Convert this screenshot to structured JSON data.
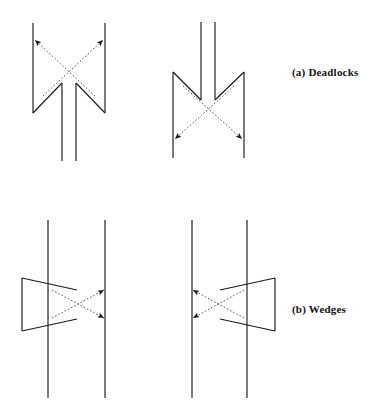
{
  "figure": {
    "background_color": "#ffffff",
    "stroke_color": "#1a1a1a",
    "dashed_stroke_color": "#3a3a3a",
    "captions": [
      {
        "id": "a",
        "label": "(a) Deadlocks",
        "x": 292,
        "y": 66
      },
      {
        "id": "b",
        "label": "(b) Wedges",
        "x": 292,
        "y": 303
      }
    ],
    "panels": [
      {
        "name": "deadlock-left",
        "row": "a",
        "column": "left",
        "description": "Two solid strands open upward with inward diagonal arms; dashed arrows point up-outward to the outer strand tops.",
        "solid_strands": [
          {
            "name": "outer-left-vertical",
            "x1": 33,
            "y1": 23,
            "x2": 33,
            "y2": 113
          },
          {
            "name": "outer-right-vertical",
            "x1": 105,
            "y1": 23,
            "x2": 105,
            "y2": 113
          },
          {
            "name": "inner-left-vertical",
            "x1": 62,
            "y1": 83,
            "x2": 62,
            "y2": 161
          },
          {
            "name": "inner-right-vertical",
            "x1": 76,
            "y1": 83,
            "x2": 76,
            "y2": 161
          },
          {
            "name": "left-arm-diagonal",
            "x1": 33,
            "y1": 113,
            "x2": 62,
            "y2": 83
          },
          {
            "name": "right-arm-diagonal",
            "x1": 105,
            "y1": 113,
            "x2": 76,
            "y2": 83
          }
        ],
        "dashed_arrows": [
          {
            "name": "arrow-up-left",
            "x1": 95,
            "y1": 96,
            "x2": 35,
            "y2": 40,
            "arrowhead_at": "end"
          },
          {
            "name": "arrow-up-right",
            "x1": 43,
            "y1": 96,
            "x2": 103,
            "y2": 40,
            "arrowhead_at": "end"
          }
        ]
      },
      {
        "name": "deadlock-right",
        "row": "a",
        "column": "right",
        "description": "Vertical mirror of the left panel: two solid strands open downward with diagonal arms; dashed arrows point down-outward.",
        "solid_strands": [
          {
            "name": "outer-left-vertical",
            "x1": 173,
            "y1": 72,
            "x2": 173,
            "y2": 158
          },
          {
            "name": "outer-right-vertical",
            "x1": 244,
            "y1": 72,
            "x2": 244,
            "y2": 158
          },
          {
            "name": "inner-left-vertical",
            "x1": 201,
            "y1": 22,
            "x2": 201,
            "y2": 100
          },
          {
            "name": "inner-right-vertical",
            "x1": 215,
            "y1": 22,
            "x2": 215,
            "y2": 100
          },
          {
            "name": "left-arm-diagonal",
            "x1": 173,
            "y1": 72,
            "x2": 201,
            "y2": 100
          },
          {
            "name": "right-arm-diagonal",
            "x1": 244,
            "y1": 72,
            "x2": 215,
            "y2": 100
          }
        ],
        "dashed_arrows": [
          {
            "name": "arrow-down-left",
            "x1": 234,
            "y1": 86,
            "x2": 175,
            "y2": 139,
            "arrowhead_at": "end"
          },
          {
            "name": "arrow-down-right",
            "x1": 183,
            "y1": 86,
            "x2": 242,
            "y2": 139,
            "arrowhead_at": "end"
          }
        ]
      },
      {
        "name": "wedge-left",
        "row": "b",
        "column": "left",
        "description": "Two long solid strands crossed by a leftward-pointing solid wedge; dashed arrows point right to the right strand.",
        "solid_strands": [
          {
            "name": "left-vertical",
            "x1": 48,
            "y1": 220,
            "x2": 48,
            "y2": 398
          },
          {
            "name": "right-vertical",
            "x1": 105,
            "y1": 220,
            "x2": 105,
            "y2": 398
          },
          {
            "name": "wedge-spine",
            "x1": 22,
            "y1": 278,
            "x2": 22,
            "y2": 331
          },
          {
            "name": "wedge-top-edge",
            "x1": 22,
            "y1": 278,
            "x2": 77,
            "y2": 290
          },
          {
            "name": "wedge-bottom-edge",
            "x1": 22,
            "y1": 331,
            "x2": 77,
            "y2": 319
          }
        ],
        "dashed_arrows": [
          {
            "name": "arrow-right-up",
            "x1": 52,
            "y1": 318,
            "x2": 104,
            "y2": 290,
            "arrowhead_at": "end"
          },
          {
            "name": "arrow-right-down",
            "x1": 52,
            "y1": 290,
            "x2": 104,
            "y2": 318,
            "arrowhead_at": "end"
          }
        ]
      },
      {
        "name": "wedge-right",
        "row": "b",
        "column": "right",
        "description": "Horizontal mirror of the left wedge panel: rightward-pointing solid wedge; dashed arrows point left to the left strand.",
        "solid_strands": [
          {
            "name": "left-vertical",
            "x1": 192,
            "y1": 220,
            "x2": 192,
            "y2": 398
          },
          {
            "name": "right-vertical",
            "x1": 247,
            "y1": 220,
            "x2": 247,
            "y2": 398
          },
          {
            "name": "wedge-spine",
            "x1": 275,
            "y1": 278,
            "x2": 275,
            "y2": 331
          },
          {
            "name": "wedge-top-edge",
            "x1": 275,
            "y1": 278,
            "x2": 220,
            "y2": 290
          },
          {
            "name": "wedge-bottom-edge",
            "x1": 275,
            "y1": 331,
            "x2": 220,
            "y2": 319
          }
        ],
        "dashed_arrows": [
          {
            "name": "arrow-left-up",
            "x1": 244,
            "y1": 318,
            "x2": 193,
            "y2": 290,
            "arrowhead_at": "end"
          },
          {
            "name": "arrow-left-down",
            "x1": 244,
            "y1": 290,
            "x2": 193,
            "y2": 318,
            "arrowhead_at": "end"
          }
        ]
      }
    ]
  }
}
